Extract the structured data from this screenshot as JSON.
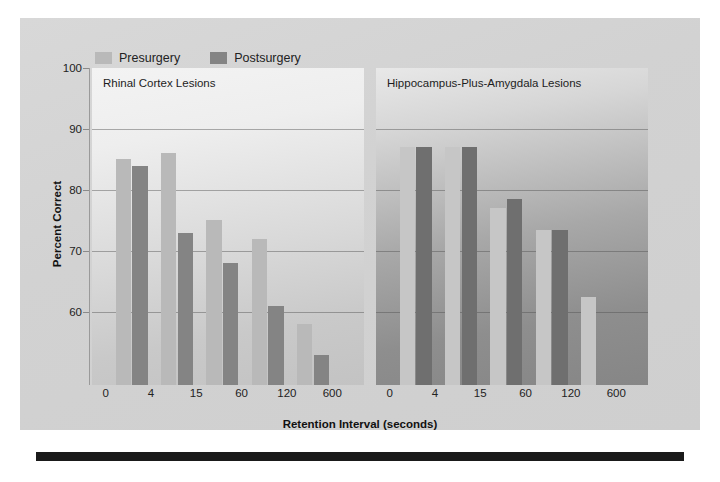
{
  "legend": {
    "items": [
      {
        "label": "Presurgery",
        "color": "#b9b9b9",
        "key": "pre"
      },
      {
        "label": "Postsurgery",
        "color": "#848484",
        "key": "post"
      }
    ]
  },
  "axes": {
    "ylabel": "Percent Correct",
    "xlabel": "Retention Interval (seconds)",
    "yticks": [
      100,
      90,
      80,
      70,
      60
    ],
    "ytick_labels": [
      "100",
      "90",
      "80",
      "70",
      "60"
    ],
    "ylim": [
      48,
      100
    ],
    "xtick_labels": [
      "0",
      "4",
      "15",
      "60",
      "120",
      "600"
    ]
  },
  "panels": [
    {
      "id": "panel-left",
      "title": "Rhinal Cortex Lesions"
    },
    {
      "id": "panel-right",
      "title": "Hippocampus-Plus-Amygdala Lesions"
    }
  ],
  "chart_data": {
    "type": "bar",
    "title": "",
    "subtitle": "",
    "xlabel": "Retention Interval (seconds)",
    "ylabel": "Percent Correct",
    "ylim": [
      48,
      100
    ],
    "yticks": [
      60,
      70,
      80,
      90,
      100
    ],
    "grid": "horizontal",
    "legend_position": "top-left",
    "legend_entries": [
      "Presurgery",
      "Postsurgery"
    ],
    "categories": [
      "0",
      "4",
      "15",
      "60",
      "120",
      "600"
    ],
    "panels": [
      {
        "label": "Rhinal Cortex Lesions",
        "series": [
          {
            "name": "Presurgery",
            "values": [
              null,
              85,
              86,
              75,
              72,
              58
            ]
          },
          {
            "name": "Postsurgery",
            "values": [
              null,
              84,
              73,
              68,
              61,
              53
            ]
          }
        ]
      },
      {
        "label": "Hippocampus-Plus-Amygdala Lesions",
        "series": [
          {
            "name": "Presurgery",
            "values": [
              null,
              87,
              87,
              77,
              73.5,
              62.5
            ]
          },
          {
            "name": "Postsurgery",
            "values": [
              null,
              87,
              87,
              78.5,
              73.5,
              null
            ]
          }
        ]
      }
    ]
  }
}
